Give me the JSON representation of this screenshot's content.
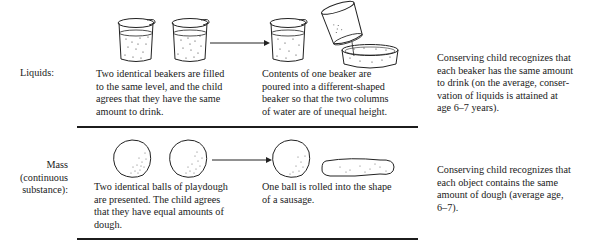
{
  "figure": {
    "rows": [
      {
        "label": "Liquids:",
        "initial_description": "Two identical beakers are filled\nto the same level, and the child\nagrees that they have the same\namount to drink.",
        "transformation_description": "Contents of one beaker are\npoured into a different-shaped\nbeaker so that the two columns\nof water are of unequal height.",
        "conserving_response": "Conserving child recognizes that\neach beaker has the same amount\nto drink (on the average, conser-\nvation of liquids is attained at\nage 6–7 years).",
        "illustrations": {
          "initial": [
            "beaker-icon",
            "beaker-icon"
          ],
          "transformation": [
            "beaker-icon",
            "pouring-beaker-icon",
            "wide-dish-icon"
          ]
        }
      },
      {
        "label": "Mass\n(continuous\nsubstance):",
        "initial_description": "Two identical balls of playdough\nare presented. The child agrees\nthat they have equal amounts of\ndough.",
        "transformation_description": "One ball is rolled into the shape\nof a sausage.",
        "conserving_response": "Conserving child recognizes that\neach object contains the same\namount of dough (average age,\n6–7).",
        "illustrations": {
          "initial": [
            "dough-ball-icon",
            "dough-ball-icon"
          ],
          "transformation": [
            "dough-ball-icon",
            "dough-sausage-icon"
          ]
        }
      }
    ],
    "arrow": "right-arrow-icon",
    "colors": {
      "ink": "#1a1a1a",
      "background": "#ffffff"
    }
  }
}
